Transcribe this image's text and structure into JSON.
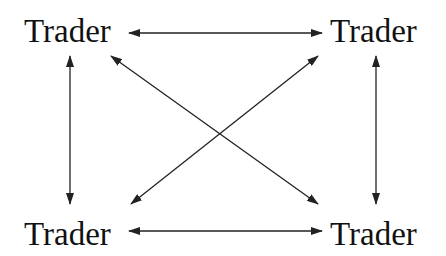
{
  "nodes": {
    "top_left": "Trader",
    "top_right": "Trader",
    "bottom_left": "Trader",
    "bottom_right": "Trader"
  },
  "edges": [
    {
      "from": "top_left",
      "to": "top_right",
      "bidirectional": true
    },
    {
      "from": "bottom_left",
      "to": "bottom_right",
      "bidirectional": true
    },
    {
      "from": "top_left",
      "to": "bottom_left",
      "bidirectional": true
    },
    {
      "from": "top_right",
      "to": "bottom_right",
      "bidirectional": true
    },
    {
      "from": "top_left",
      "to": "bottom_right",
      "bidirectional": true
    },
    {
      "from": "top_right",
      "to": "bottom_left",
      "bidirectional": true
    }
  ],
  "colors": {
    "line": "#222222",
    "text": "#111111"
  }
}
